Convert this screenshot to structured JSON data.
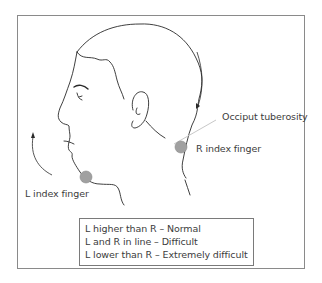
{
  "figure": {
    "labels": {
      "occiput": "Occiput tuberosity",
      "right_finger": "R index finger",
      "left_finger": "L index finger"
    },
    "legend": [
      "L higher than R – Normal",
      "L and R in line – Difficult",
      "L lower than R – Extremely difficult"
    ],
    "colors": {
      "line": "#2a2a2a",
      "frame": "#8a8a8a",
      "finger_marker": "#a0a0a0",
      "pointer_line": "#c8c8c8"
    }
  }
}
